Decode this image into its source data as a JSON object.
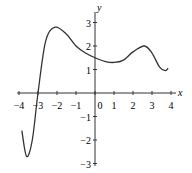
{
  "chart_data": {
    "type": "line",
    "title": "",
    "xlabel": "x",
    "ylabel": "y",
    "xlim": [
      -4,
      4
    ],
    "ylim": [
      -3,
      3
    ],
    "x_ticks": [
      "-4",
      "-3",
      "-2",
      "-1",
      "0",
      "1",
      "2",
      "3",
      "4"
    ],
    "y_ticks": [
      "3",
      "2",
      "1",
      "-1",
      "-2",
      "-3"
    ],
    "grid": false,
    "series": [
      {
        "name": "f(x)",
        "x": [
          -3.85,
          -3.6,
          -3.3,
          -3.0,
          -2.6,
          -2.1,
          -1.5,
          -1.0,
          -0.5,
          0,
          0.5,
          1.0,
          1.5,
          2.0,
          2.6,
          3.0,
          3.4,
          3.7,
          3.85
        ],
        "y": [
          -1.6,
          -2.7,
          -2.0,
          0,
          2.2,
          2.8,
          2.5,
          2.0,
          1.7,
          1.5,
          1.35,
          1.3,
          1.4,
          1.75,
          2.0,
          1.7,
          1.1,
          0.95,
          1.05
        ]
      }
    ]
  }
}
